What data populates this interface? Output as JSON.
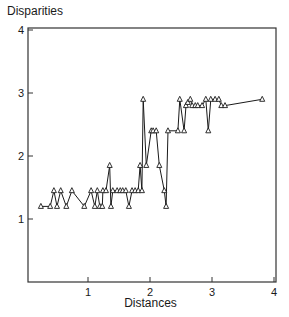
{
  "chart_data": {
    "type": "line",
    "title": "",
    "xlabel": "Distances",
    "ylabel": "Disparities",
    "xlim": [
      0,
      4
    ],
    "ylim": [
      0,
      4
    ],
    "xticks": [
      1,
      2,
      3,
      4
    ],
    "yticks": [
      1,
      2,
      3,
      4
    ],
    "grid": false,
    "legend": null,
    "marker": "triangle-up",
    "line_color": "#1a1a1a",
    "series": [
      {
        "name": "disparities",
        "x": [
          0.24,
          0.39,
          0.45,
          0.5,
          0.56,
          0.65,
          0.74,
          0.94,
          1.05,
          1.11,
          1.15,
          1.19,
          1.23,
          1.24,
          1.29,
          1.35,
          1.37,
          1.4,
          1.47,
          1.52,
          1.56,
          1.61,
          1.66,
          1.71,
          1.76,
          1.81,
          1.84,
          1.87,
          1.89,
          1.94,
          2.02,
          2.05,
          2.1,
          2.15,
          2.23,
          2.26,
          2.29,
          2.45,
          2.48,
          2.55,
          2.58,
          2.61,
          2.65,
          2.68,
          2.73,
          2.77,
          2.84,
          2.9,
          2.94,
          2.98,
          3.05,
          3.11,
          3.15,
          3.21,
          3.81
        ],
        "y": [
          1.2,
          1.2,
          1.45,
          1.2,
          1.45,
          1.2,
          1.45,
          1.2,
          1.45,
          1.2,
          1.45,
          1.2,
          1.2,
          1.45,
          1.45,
          1.85,
          1.2,
          1.45,
          1.45,
          1.45,
          1.45,
          1.45,
          1.2,
          1.45,
          1.45,
          1.45,
          1.85,
          1.45,
          2.9,
          1.85,
          2.4,
          2.4,
          2.4,
          1.85,
          1.45,
          1.2,
          2.4,
          2.4,
          2.9,
          2.4,
          2.8,
          2.85,
          2.9,
          2.8,
          2.8,
          2.8,
          2.8,
          2.9,
          2.4,
          2.9,
          2.9,
          2.9,
          2.8,
          2.8,
          2.9
        ]
      }
    ]
  },
  "labels": {
    "ylabel": "Disparities",
    "xlabel": "Distances"
  }
}
